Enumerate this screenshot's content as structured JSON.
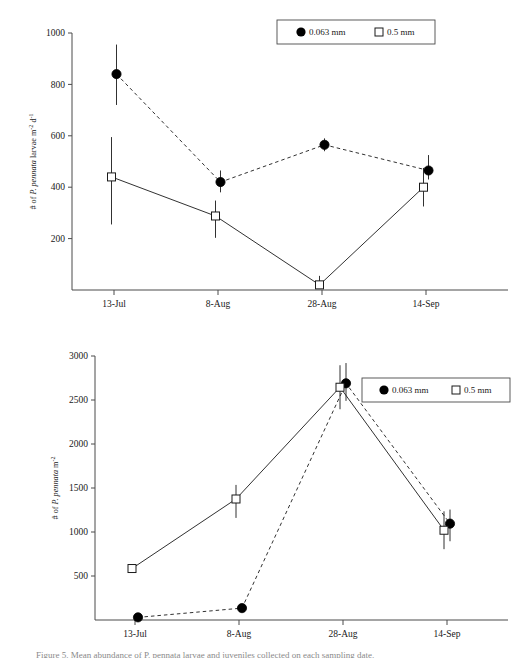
{
  "figure": {
    "background_color": "#ffffff",
    "line_color": "#1a1a1a",
    "marker_fill_closed": "#000000",
    "marker_fill_open": "#ffffff",
    "caption_partial": "Figure 5. Mean abundance of P. pennata larvae and juveniles collected on each sampling date."
  },
  "panels": [
    {
      "id": "top",
      "legend": {
        "position": "top-right",
        "entries": [
          {
            "marker": "filled-circle",
            "label": "0.063 mm"
          },
          {
            "marker": "open-square",
            "label": "0.5 mm"
          }
        ]
      },
      "chart_data": {
        "type": "line",
        "title": "",
        "xlabel": "",
        "ylabel": "# of P. pennata larvae m-2 d-1",
        "ylabel_parts": {
          "prefix": "# of ",
          "italic": "P. pennata",
          "middle": " larvae m",
          "sup1": "-2",
          "middle2": " d",
          "sup2": "-1"
        },
        "categories": [
          "13-Jul",
          "8-Aug",
          "28-Aug",
          "14-Sep"
        ],
        "ylim": [
          0,
          1000
        ],
        "yticks": [
          200,
          400,
          600,
          800,
          1000
        ],
        "grid": false,
        "series": [
          {
            "name": "0.063 mm",
            "marker": "filled-circle",
            "linestyle": "dashed",
            "values": [
              840,
              420,
              565,
              465
            ],
            "err_low": [
              120,
              40,
              25,
              35
            ],
            "err_high": [
              115,
              45,
              25,
              60
            ]
          },
          {
            "name": "0.5 mm",
            "marker": "open-square",
            "linestyle": "solid",
            "values": [
              440,
              288,
              20,
              400
            ],
            "err_low": [
              185,
              85,
              0,
              75
            ],
            "err_high": [
              155,
              60,
              35,
              75
            ]
          }
        ]
      }
    },
    {
      "id": "bottom",
      "legend": {
        "position": "center-right",
        "entries": [
          {
            "marker": "filled-circle",
            "label": "0.063 mm"
          },
          {
            "marker": "open-square",
            "label": "0.5 mm"
          }
        ]
      },
      "chart_data": {
        "type": "line",
        "title": "",
        "xlabel": "",
        "ylabel": "# of P. pennata m-2",
        "ylabel_parts": {
          "prefix": "# of ",
          "italic": "P. pennata",
          "middle": " m",
          "sup1": "-2",
          "middle2": "",
          "sup2": ""
        },
        "categories": [
          "13-Jul",
          "8-Aug",
          "28-Aug",
          "14-Sep"
        ],
        "ylim": [
          0,
          3000
        ],
        "yticks": [
          500,
          1000,
          1500,
          2000,
          2500,
          3000
        ],
        "grid": false,
        "series": [
          {
            "name": "0.063 mm",
            "marker": "filled-circle",
            "linestyle": "dashed",
            "values": [
              30,
              135,
              2690,
              1095
            ],
            "err_low": [
              0,
              0,
              200,
              200
            ],
            "err_high": [
              0,
              0,
              230,
              160
            ]
          },
          {
            "name": "0.5 mm",
            "marker": "open-square",
            "linestyle": "solid",
            "values": [
              585,
              1375,
              2645,
              1020
            ],
            "err_low": [
              0,
              215,
              250,
              215
            ],
            "err_high": [
              0,
              160,
              250,
              215
            ]
          }
        ]
      }
    }
  ]
}
